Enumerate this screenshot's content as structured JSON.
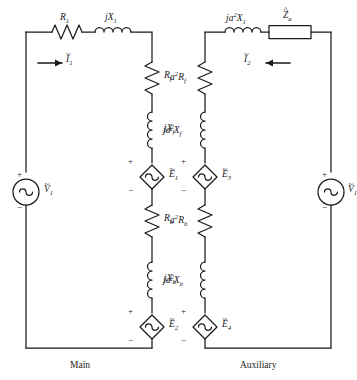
{
  "figure": {
    "type": "circuit-diagram",
    "captions": {
      "left": "Main",
      "right": "Auxiliary"
    }
  },
  "colors": {
    "wire": "#1a1a1a",
    "background": "#ffffff",
    "text": "#1a1a1a"
  },
  "labels": {
    "r1": {
      "base": "R",
      "sub": "1",
      "pre": "",
      "accent": "none"
    },
    "jx1": {
      "base": "jX",
      "sub": "1",
      "pre": "",
      "accent": "none"
    },
    "i1": {
      "base": "I",
      "sub": "1",
      "pre": "",
      "accent": "tilde"
    },
    "v1_left": {
      "base": "V",
      "sub": "1",
      "pre": "",
      "accent": "tilde"
    },
    "rf": {
      "base": "R",
      "sub": "f",
      "pre": "",
      "accent": "none"
    },
    "jxf": {
      "base": "jX",
      "sub": "f",
      "pre": "",
      "accent": "none"
    },
    "e1": {
      "base": "E",
      "sub": "1",
      "pre": "",
      "accent": "tilde"
    },
    "rb": {
      "base": "R",
      "sub": "b",
      "pre": "",
      "accent": "none"
    },
    "jxb": {
      "base": "jX",
      "sub": "b",
      "pre": "",
      "accent": "none"
    },
    "e2": {
      "base": "E",
      "sub": "2",
      "pre": "",
      "accent": "tilde"
    },
    "ja2x1": {
      "base": "X",
      "sub": "1",
      "pre": "ja2",
      "accent": "none"
    },
    "za": {
      "base": "Z",
      "sub": "a",
      "pre": "",
      "accent": "hat"
    },
    "i2": {
      "base": "I",
      "sub": "2",
      "pre": "",
      "accent": "tilde"
    },
    "v1_right": {
      "base": "V",
      "sub": "1",
      "pre": "",
      "accent": "tilde"
    },
    "a2rf": {
      "base": "R",
      "sub": "f",
      "pre": "a2",
      "accent": "none"
    },
    "ja2xf": {
      "base": "X",
      "sub": "f",
      "pre": "ja2",
      "accent": "none"
    },
    "e3": {
      "base": "E",
      "sub": "3",
      "pre": "",
      "accent": "tilde"
    },
    "a2rb": {
      "base": "R",
      "sub": "b",
      "pre": "a2",
      "accent": "none"
    },
    "ja2xb": {
      "base": "X",
      "sub": "b",
      "pre": "ja2",
      "accent": "none"
    },
    "e4": {
      "base": "E",
      "sub": "4",
      "pre": "",
      "accent": "tilde"
    }
  },
  "text": {
    "r1": "R1",
    "jx1": "jX1",
    "i1": "I1",
    "v1_left": "V1",
    "rf": "Rf",
    "jxf": "jXf",
    "e1": "E1",
    "rb": "Rb",
    "jxb": "jXb",
    "e2": "E2",
    "ja2x1": "ja2X1",
    "za": "Za",
    "i2": "I2",
    "v1_right": "V1",
    "a2rf": "a2Rf",
    "ja2xf": "ja2Xf",
    "e3": "E3",
    "a2rb": "a2Rb",
    "ja2xb": "ja2Xb",
    "e4": "E4",
    "plus": "+",
    "minus": "−",
    "caption_left": "Main",
    "caption_right": "Auxiliary"
  },
  "components": {
    "main_loop": [
      {
        "name": "resistor-r1",
        "kind": "resistor",
        "label": "R1",
        "orientation": "horizontal"
      },
      {
        "name": "inductor-jx1",
        "kind": "inductor",
        "label": "jX1",
        "orientation": "horizontal"
      },
      {
        "name": "source-v1-left",
        "kind": "independent-source",
        "label": "V1",
        "orientation": "vertical"
      },
      {
        "name": "resistor-rf",
        "kind": "resistor",
        "label": "Rf",
        "orientation": "vertical"
      },
      {
        "name": "inductor-jxf",
        "kind": "inductor",
        "label": "jXf",
        "orientation": "vertical"
      },
      {
        "name": "source-e1",
        "kind": "dependent-source",
        "label": "E1",
        "orientation": "vertical"
      },
      {
        "name": "resistor-rb",
        "kind": "resistor",
        "label": "Rb",
        "orientation": "vertical"
      },
      {
        "name": "inductor-jxb",
        "kind": "inductor",
        "label": "jXb",
        "orientation": "vertical"
      },
      {
        "name": "source-e2",
        "kind": "dependent-source",
        "label": "E2",
        "orientation": "vertical"
      }
    ],
    "auxiliary_loop": [
      {
        "name": "inductor-ja2x1",
        "kind": "inductor",
        "label": "ja2X1",
        "orientation": "horizontal"
      },
      {
        "name": "impedance-za",
        "kind": "impedance-box",
        "label": "Za",
        "orientation": "horizontal"
      },
      {
        "name": "source-v1-right",
        "kind": "independent-source",
        "label": "V1",
        "orientation": "vertical"
      },
      {
        "name": "resistor-a2rf",
        "kind": "resistor",
        "label": "a2Rf",
        "orientation": "vertical"
      },
      {
        "name": "inductor-ja2xf",
        "kind": "inductor",
        "label": "ja2Xf",
        "orientation": "vertical"
      },
      {
        "name": "source-e3",
        "kind": "dependent-source",
        "label": "E3",
        "orientation": "vertical"
      },
      {
        "name": "resistor-a2rb",
        "kind": "resistor",
        "label": "a2Rb",
        "orientation": "vertical"
      },
      {
        "name": "inductor-ja2xb",
        "kind": "inductor",
        "label": "ja2Xb",
        "orientation": "vertical"
      },
      {
        "name": "source-e4",
        "kind": "dependent-source",
        "label": "E4",
        "orientation": "vertical"
      }
    ],
    "currents": [
      {
        "name": "current-i1",
        "label": "I1",
        "direction": "right",
        "loop": "main"
      },
      {
        "name": "current-i2",
        "label": "I2",
        "direction": "left",
        "loop": "auxiliary"
      }
    ]
  }
}
